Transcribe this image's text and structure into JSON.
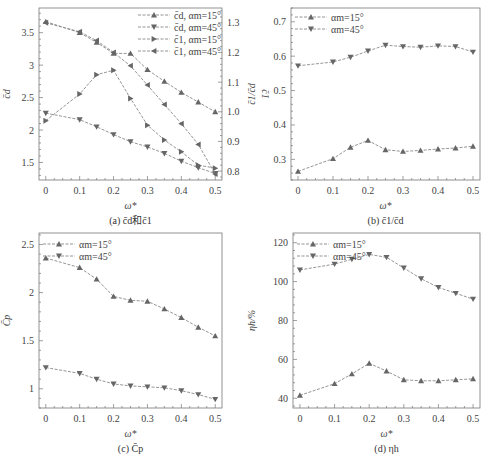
{
  "figure": {
    "panels": [
      "a",
      "b",
      "c",
      "d"
    ]
  },
  "chart_data": [
    {
      "id": "a",
      "type": "line",
      "caption": "(a)  c̄d和c̄1",
      "xlabel": "ω*",
      "ylabel_left": "c̄d",
      "ylabel_right": "c̄1",
      "x": [
        0,
        0.1,
        0.15,
        0.2,
        0.25,
        0.3,
        0.35,
        0.4,
        0.45,
        0.5
      ],
      "xticks": [
        0,
        0.1,
        0.2,
        0.3,
        0.4,
        0.5
      ],
      "xtick_labels": [
        "0",
        "0.1",
        "0.2",
        "0.3",
        "0.4",
        "0.5"
      ],
      "xlim": [
        -0.02,
        0.52
      ],
      "ylim_left": [
        1.23,
        3.88
      ],
      "yticks_left": [
        1.5,
        2,
        2.5,
        3,
        3.5
      ],
      "ytick_labels_left": [
        "1.5",
        "2",
        "2.5",
        "3",
        "3.5"
      ],
      "ylim_right": [
        0.77,
        1.35
      ],
      "yticks_right": [
        0.8,
        0.9,
        1.0,
        1.1,
        1.2,
        1.3
      ],
      "ytick_labels_right": [
        "0.8",
        "0.9",
        "1.0",
        "1.1",
        "1.2",
        "1.3"
      ],
      "legend_position": "upper right",
      "series": [
        {
          "name": "c̄d, αm=15°",
          "label_main": "c̄d",
          "label_angle": "αm=15°",
          "axis": "left",
          "marker": "triangle-up",
          "values": [
            3.67,
            3.5,
            3.35,
            3.18,
            3.18,
            2.93,
            2.75,
            2.58,
            2.43,
            2.28
          ]
        },
        {
          "name": "c̄d, αm=45°",
          "label_main": "c̄d",
          "label_angle": "αm=45°",
          "axis": "left",
          "marker": "triangle-down",
          "values": [
            2.26,
            2.16,
            2.05,
            1.93,
            1.82,
            1.74,
            1.64,
            1.52,
            1.42,
            1.33
          ]
        },
        {
          "name": "c̄1, αm=15°",
          "label_main": "c̄1",
          "label_angle": "αm=15°",
          "axis": "right",
          "marker": "triangle-right",
          "values": [
            0.97,
            1.06,
            1.125,
            1.14,
            1.045,
            0.955,
            0.905,
            0.865,
            0.82,
            0.81
          ]
        },
        {
          "name": "c̄1, αm=45°",
          "label_main": "c̄1",
          "label_angle": "αm=45°",
          "axis": "right",
          "marker": "triangle-left",
          "values": [
            1.3,
            1.27,
            1.24,
            1.2,
            1.155,
            1.09,
            1.025,
            0.96,
            0.89,
            0.79
          ]
        }
      ]
    },
    {
      "id": "b",
      "type": "line",
      "caption": "(b)  c̄1/c̄d",
      "xlabel": "ω*",
      "ylabel": "c̄1/c̄d",
      "x": [
        0,
        0.1,
        0.15,
        0.2,
        0.25,
        0.3,
        0.35,
        0.4,
        0.45,
        0.5
      ],
      "xticks": [
        0,
        0.1,
        0.2,
        0.3,
        0.4,
        0.5
      ],
      "xtick_labels": [
        "0",
        "0.1",
        "0.2",
        "0.3",
        "0.4",
        "0.5"
      ],
      "xlim": [
        -0.02,
        0.52
      ],
      "ylim": [
        0.24,
        0.74
      ],
      "yticks": [
        0.3,
        0.4,
        0.5,
        0.6,
        0.7
      ],
      "ytick_labels": [
        "0.3",
        "0.4",
        "0.5",
        "0.6",
        "0.7"
      ],
      "legend_position": "upper left",
      "series": [
        {
          "name": "αm=15°",
          "marker": "triangle-up",
          "values": [
            0.265,
            0.302,
            0.335,
            0.355,
            0.328,
            0.323,
            0.326,
            0.33,
            0.333,
            0.338
          ]
        },
        {
          "name": "αm=45°",
          "marker": "triangle-down",
          "values": [
            0.572,
            0.583,
            0.597,
            0.615,
            0.632,
            0.628,
            0.626,
            0.63,
            0.628,
            0.612
          ]
        }
      ]
    },
    {
      "id": "c",
      "type": "line",
      "caption": "(c)  C̄p",
      "xlabel": "ω*",
      "ylabel": "C̄p",
      "x": [
        0,
        0.1,
        0.15,
        0.2,
        0.25,
        0.3,
        0.35,
        0.4,
        0.45,
        0.5
      ],
      "xticks": [
        0,
        0.1,
        0.2,
        0.3,
        0.4,
        0.5
      ],
      "xtick_labels": [
        "0",
        "0.1",
        "0.2",
        "0.3",
        "0.4",
        "0.5"
      ],
      "xlim": [
        -0.02,
        0.52
      ],
      "ylim": [
        0.8,
        2.62
      ],
      "yticks": [
        1,
        1.5,
        2,
        2.5
      ],
      "ytick_labels": [
        "1",
        "1.5",
        "2",
        "2.5"
      ],
      "legend_position": "upper left",
      "series": [
        {
          "name": "αm=15°",
          "marker": "triangle-up",
          "values": [
            2.36,
            2.26,
            2.14,
            1.96,
            1.92,
            1.91,
            1.83,
            1.74,
            1.64,
            1.55
          ]
        },
        {
          "name": "αm=45°",
          "marker": "triangle-down",
          "values": [
            1.22,
            1.16,
            1.1,
            1.05,
            1.03,
            1.02,
            1.01,
            0.98,
            0.94,
            0.89
          ]
        }
      ]
    },
    {
      "id": "d",
      "type": "line",
      "caption": "(d)  ηh",
      "xlabel": "ω*",
      "ylabel": "ηh/%",
      "x": [
        0,
        0.1,
        0.15,
        0.2,
        0.25,
        0.3,
        0.35,
        0.4,
        0.45,
        0.5
      ],
      "xticks": [
        0,
        0.1,
        0.2,
        0.3,
        0.4,
        0.5
      ],
      "xtick_labels": [
        "0",
        "0.1",
        "0.2",
        "0.3",
        "0.4",
        "0.5"
      ],
      "xlim": [
        -0.02,
        0.52
      ],
      "ylim": [
        35,
        125
      ],
      "yticks": [
        40,
        60,
        80,
        100,
        120
      ],
      "ytick_labels": [
        "40",
        "60",
        "80",
        "100",
        "120"
      ],
      "legend_position": "upper left",
      "series": [
        {
          "name": "αm=15°",
          "marker": "triangle-up",
          "values": [
            41.5,
            47.5,
            52.5,
            58.0,
            54.0,
            49.5,
            49.0,
            49.0,
            49.5,
            50.0
          ]
        },
        {
          "name": "αm=45°",
          "marker": "triangle-down",
          "values": [
            106,
            109,
            111.5,
            114,
            112.5,
            107,
            101.5,
            97,
            94,
            91
          ]
        }
      ]
    }
  ]
}
